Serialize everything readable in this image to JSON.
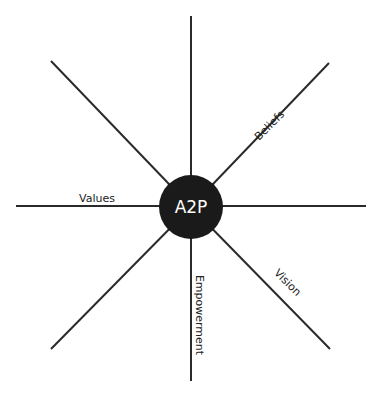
{
  "diagram": {
    "center": {
      "label": "A2P",
      "fill": "#1a1a1a",
      "text_color": "#ffffff"
    },
    "spokes": [
      {
        "label": "Beliefs",
        "direction": "north-east"
      },
      {
        "label": "Values",
        "direction": "west"
      },
      {
        "label": "Empowerment",
        "direction": "south"
      },
      {
        "label": "Vision",
        "direction": "south-east"
      }
    ],
    "line_color": "#2a2a2a"
  }
}
